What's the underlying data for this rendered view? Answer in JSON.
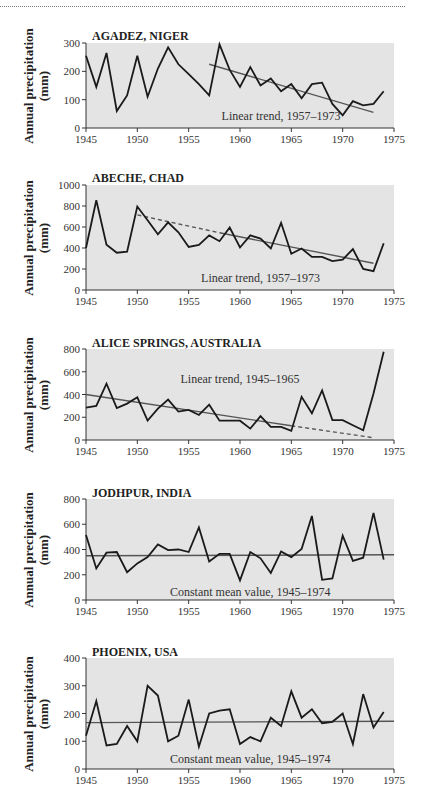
{
  "figure": {
    "ylabel_line1": "Annual precipitation",
    "ylabel_line2": "(mm)",
    "xticks": [
      1945,
      1950,
      1955,
      1960,
      1965,
      1970,
      1975
    ]
  },
  "chart_data": [
    {
      "type": "line",
      "title": "AGADEZ, NIGER",
      "xlabel": "",
      "ylabel": "Annual precipitation (mm)",
      "xlim": [
        1945,
        1975
      ],
      "ylim": [
        0,
        300
      ],
      "yticks": [
        0,
        100,
        200,
        300
      ],
      "x": [
        1945,
        1946,
        1947,
        1948,
        1949,
        1950,
        1951,
        1952,
        1953,
        1954,
        1955,
        1956,
        1957,
        1958,
        1959,
        1960,
        1961,
        1962,
        1963,
        1964,
        1965,
        1966,
        1967,
        1968,
        1969,
        1970,
        1971,
        1972,
        1973,
        1974
      ],
      "values": [
        255,
        145,
        265,
        60,
        115,
        255,
        110,
        210,
        285,
        225,
        190,
        155,
        115,
        295,
        205,
        145,
        215,
        150,
        175,
        130,
        155,
        105,
        155,
        160,
        85,
        45,
        95,
        80,
        85,
        130
      ],
      "trend": {
        "label": "Linear trend, 1957–1973",
        "style": "solid",
        "from": [
          1957,
          225
        ],
        "to": [
          1973,
          55
        ]
      },
      "annotation": {
        "text": "Linear trend, 1957–1973",
        "x": 1964,
        "y": 42
      }
    },
    {
      "type": "line",
      "title": "ABECHE, CHAD",
      "xlabel": "",
      "ylabel": "Annual precipitation (mm)",
      "xlim": [
        1945,
        1975
      ],
      "ylim": [
        0,
        1000
      ],
      "yticks": [
        0,
        200,
        400,
        600,
        800,
        1000
      ],
      "x": [
        1945,
        1946,
        1947,
        1948,
        1949,
        1950,
        1951,
        1952,
        1953,
        1954,
        1955,
        1956,
        1957,
        1958,
        1959,
        1960,
        1961,
        1962,
        1963,
        1964,
        1965,
        1966,
        1967,
        1968,
        1969,
        1970,
        1971,
        1972,
        1973,
        1974
      ],
      "values": [
        400,
        855,
        430,
        355,
        365,
        795,
        665,
        530,
        645,
        550,
        410,
        430,
        520,
        465,
        595,
        405,
        520,
        490,
        395,
        640,
        345,
        395,
        315,
        315,
        275,
        290,
        390,
        200,
        180,
        445
      ],
      "trend_dashed": {
        "style": "dashed",
        "from": [
          1950,
          715
        ],
        "to": [
          1958,
          545
        ]
      },
      "trend": {
        "label": "Linear trend, 1957–1973",
        "style": "solid",
        "from": [
          1958,
          545
        ],
        "to": [
          1973,
          255
        ]
      },
      "annotation": {
        "text": "Linear trend, 1957–1973",
        "x": 1962,
        "y": 115
      }
    },
    {
      "type": "line",
      "title": "ALICE SPRINGS, AUSTRALIA",
      "xlabel": "",
      "ylabel": "Annual precipitation (mm)",
      "xlim": [
        1945,
        1975
      ],
      "ylim": [
        0,
        800
      ],
      "yticks": [
        0,
        200,
        400,
        600,
        800
      ],
      "x": [
        1945,
        1946,
        1947,
        1948,
        1949,
        1950,
        1951,
        1952,
        1953,
        1954,
        1955,
        1956,
        1957,
        1958,
        1959,
        1960,
        1961,
        1962,
        1963,
        1964,
        1965,
        1966,
        1967,
        1968,
        1969,
        1970,
        1971,
        1972,
        1973,
        1974
      ],
      "values": [
        285,
        300,
        495,
        280,
        320,
        375,
        170,
        275,
        355,
        250,
        265,
        220,
        310,
        170,
        170,
        170,
        100,
        210,
        115,
        115,
        80,
        380,
        235,
        435,
        175,
        175,
        130,
        85,
        410,
        775
      ],
      "trend": {
        "label": "Linear trend, 1945–1965",
        "style": "solid",
        "from": [
          1945,
          400
        ],
        "to": [
          1965,
          125
        ]
      },
      "trend_dashed": {
        "style": "dashed",
        "from": [
          1965,
          125
        ],
        "to": [
          1973,
          20
        ]
      },
      "annotation": {
        "text": "Linear trend, 1945–1965",
        "x": 1960,
        "y": 535
      }
    },
    {
      "type": "line",
      "title": "JODHPUR, INDIA",
      "xlabel": "",
      "ylabel": "Annual precipitation (mm)",
      "xlim": [
        1945,
        1975
      ],
      "ylim": [
        0,
        800
      ],
      "yticks": [
        0,
        200,
        400,
        600,
        800
      ],
      "x": [
        1945,
        1946,
        1947,
        1948,
        1949,
        1950,
        1951,
        1952,
        1953,
        1954,
        1955,
        1956,
        1957,
        1958,
        1959,
        1960,
        1961,
        1962,
        1963,
        1964,
        1965,
        1966,
        1967,
        1968,
        1969,
        1970,
        1971,
        1972,
        1973,
        1974
      ],
      "values": [
        515,
        250,
        375,
        380,
        220,
        290,
        340,
        440,
        395,
        400,
        380,
        575,
        305,
        365,
        365,
        155,
        380,
        330,
        215,
        385,
        340,
        405,
        665,
        160,
        170,
        510,
        310,
        335,
        690,
        320
      ],
      "trend": {
        "label": "Constant mean value, 1945–1974",
        "style": "solid",
        "from": [
          1945,
          350
        ],
        "to": [
          1975,
          358
        ]
      },
      "annotation": {
        "text": "Constant mean value, 1945–1974",
        "x": 1961,
        "y": 65
      }
    },
    {
      "type": "line",
      "title": "PHOENIX, USA",
      "xlabel": "",
      "ylabel": "Annual precipitation (mm)",
      "xlim": [
        1945,
        1975
      ],
      "ylim": [
        0,
        400
      ],
      "yticks": [
        0,
        100,
        200,
        300,
        400
      ],
      "x": [
        1945,
        1946,
        1947,
        1948,
        1949,
        1950,
        1951,
        1952,
        1953,
        1954,
        1955,
        1956,
        1957,
        1958,
        1959,
        1960,
        1961,
        1962,
        1963,
        1964,
        1965,
        1966,
        1967,
        1968,
        1969,
        1970,
        1971,
        1972,
        1973,
        1974
      ],
      "values": [
        120,
        245,
        85,
        90,
        155,
        100,
        300,
        265,
        100,
        120,
        250,
        80,
        200,
        210,
        215,
        90,
        115,
        100,
        185,
        155,
        280,
        185,
        215,
        165,
        170,
        200,
        90,
        270,
        150,
        205
      ],
      "trend": {
        "label": "Constant mean value, 1945–1974",
        "style": "solid",
        "from": [
          1945,
          167
        ],
        "to": [
          1975,
          172
        ]
      },
      "annotation": {
        "text": "Constant mean value, 1945–1974",
        "x": 1961,
        "y": 35
      }
    }
  ]
}
